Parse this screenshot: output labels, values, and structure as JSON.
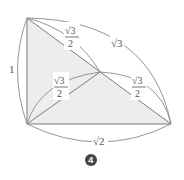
{
  "diagram": {
    "type": "tetrahedron-net-with-edge-lengths",
    "labels": {
      "left_edge": "1",
      "top_diagonal": "√3",
      "top_diagonal_den": "2",
      "outer_arc": "√3",
      "inner_left": "√3",
      "inner_left_den": "2",
      "inner_right": "√3",
      "inner_right_den": "2",
      "bottom_edge": "√2"
    },
    "badge": "4",
    "colors": {
      "line": "#7a7a7a",
      "fill": "#ededed",
      "badge": "#444444"
    }
  }
}
